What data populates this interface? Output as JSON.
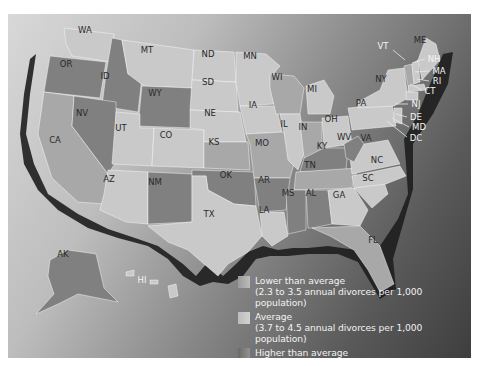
{
  "map": {
    "title": "",
    "states": [
      {
        "code": "WA",
        "x": 85,
        "y": 30,
        "cls": "low"
      },
      {
        "code": "OR",
        "x": 66,
        "y": 64,
        "cls": "high"
      },
      {
        "code": "CA",
        "x": 55,
        "y": 140,
        "cls": "avg"
      },
      {
        "code": "ID",
        "x": 105,
        "y": 76,
        "cls": "high"
      },
      {
        "code": "NV",
        "x": 82,
        "y": 113,
        "cls": "high"
      },
      {
        "code": "MT",
        "x": 147,
        "y": 50,
        "cls": "low"
      },
      {
        "code": "WY",
        "x": 155,
        "y": 93,
        "cls": "high"
      },
      {
        "code": "UT",
        "x": 121,
        "y": 128,
        "cls": "low"
      },
      {
        "code": "CO",
        "x": 166,
        "y": 135,
        "cls": "low"
      },
      {
        "code": "AZ",
        "x": 109,
        "y": 179,
        "cls": "low"
      },
      {
        "code": "NM",
        "x": 155,
        "y": 182,
        "cls": "high"
      },
      {
        "code": "ND",
        "x": 208,
        "y": 54,
        "cls": "low"
      },
      {
        "code": "SD",
        "x": 208,
        "y": 82,
        "cls": "low"
      },
      {
        "code": "NE",
        "x": 210,
        "y": 113,
        "cls": "low"
      },
      {
        "code": "KS",
        "x": 214,
        "y": 142,
        "cls": "avg"
      },
      {
        "code": "OK",
        "x": 226,
        "y": 175,
        "cls": "high"
      },
      {
        "code": "TX",
        "x": 209,
        "y": 214,
        "cls": "low"
      },
      {
        "code": "MN",
        "x": 250,
        "y": 56,
        "cls": "low"
      },
      {
        "code": "IA",
        "x": 253,
        "y": 105,
        "cls": "low"
      },
      {
        "code": "MO",
        "x": 262,
        "y": 143,
        "cls": "avg"
      },
      {
        "code": "AR",
        "x": 264,
        "y": 180,
        "cls": "high"
      },
      {
        "code": "LA",
        "x": 264,
        "y": 210,
        "cls": "low"
      },
      {
        "code": "WI",
        "x": 277,
        "y": 77,
        "cls": "avg"
      },
      {
        "code": "IL",
        "x": 284,
        "y": 124,
        "cls": "low"
      },
      {
        "code": "MI",
        "x": 312,
        "y": 89,
        "cls": "low"
      },
      {
        "code": "IN",
        "x": 303,
        "y": 127,
        "cls": "avg"
      },
      {
        "code": "OH",
        "x": 331,
        "y": 119,
        "cls": "low"
      },
      {
        "code": "KY",
        "x": 322,
        "y": 146,
        "cls": "high"
      },
      {
        "code": "TN",
        "x": 310,
        "y": 165,
        "cls": "avg"
      },
      {
        "code": "MS",
        "x": 288,
        "y": 193,
        "cls": "high"
      },
      {
        "code": "AL",
        "x": 311,
        "y": 193,
        "cls": "high"
      },
      {
        "code": "GA",
        "x": 339,
        "y": 195,
        "cls": "low"
      },
      {
        "code": "FL",
        "x": 373,
        "y": 240,
        "cls": "avg"
      },
      {
        "code": "SC",
        "x": 368,
        "y": 178,
        "cls": "low"
      },
      {
        "code": "NC",
        "x": 377,
        "y": 160,
        "cls": "low"
      },
      {
        "code": "VA",
        "x": 366,
        "y": 138,
        "cls": "low"
      },
      {
        "code": "WV",
        "x": 344,
        "y": 137,
        "cls": "high"
      },
      {
        "code": "PA",
        "x": 361,
        "y": 103,
        "cls": "low"
      },
      {
        "code": "NY",
        "x": 381,
        "y": 79,
        "cls": "low"
      },
      {
        "code": "ME",
        "x": 420,
        "y": 40,
        "cls": "low"
      },
      {
        "code": "AK",
        "x": 63,
        "y": 254,
        "cls": "high"
      },
      {
        "code": "HI",
        "x": 142,
        "y": 280,
        "cls": "low"
      }
    ],
    "callouts": [
      {
        "code": "VT",
        "tx": 383,
        "ty": 46,
        "lx1": 393,
        "ly1": 50,
        "lx2": 405,
        "ly2": 60
      },
      {
        "code": "NH",
        "tx": 434,
        "ty": 59,
        "lx1": 425,
        "ly1": 59,
        "lx2": 412,
        "ly2": 63
      },
      {
        "code": "MA",
        "tx": 439,
        "ty": 71,
        "lx1": 429,
        "ly1": 71,
        "lx2": 415,
        "ly2": 72
      },
      {
        "code": "RI",
        "tx": 437,
        "ty": 81,
        "lx1": 429,
        "ly1": 81,
        "lx2": 417,
        "ly2": 79
      },
      {
        "code": "CT",
        "tx": 430,
        "ty": 91,
        "lx1": 422,
        "ly1": 90,
        "lx2": 410,
        "ly2": 84
      },
      {
        "code": "NJ",
        "tx": 416,
        "ty": 104,
        "lx1": 408,
        "ly1": 104,
        "lx2": 395,
        "ly2": 104
      },
      {
        "code": "DE",
        "tx": 416,
        "ty": 117,
        "lx1": 407,
        "ly1": 117,
        "lx2": 396,
        "ly2": 114
      },
      {
        "code": "MD",
        "tx": 419,
        "ty": 127,
        "lx1": 409,
        "ly1": 127,
        "lx2": 392,
        "ly2": 118
      },
      {
        "code": "DC",
        "tx": 416,
        "ty": 138,
        "lx1": 407,
        "ly1": 137,
        "lx2": 387,
        "ly2": 121
      }
    ]
  },
  "legend": {
    "items": [
      {
        "label": "Lower than average",
        "detail": "(2.3 to 3.5 annual divorces per 1,000 population)",
        "swatch": "#a9a9a9"
      },
      {
        "label": "Average",
        "detail": "(3.7 to 4.5 annual divorces per 1,000 population)",
        "swatch": "#c8c8c8"
      },
      {
        "label": "Higher than average",
        "detail": "(4.9 to 6.8 annual divorces per 1,000 population)",
        "swatch": "#7d7d7d"
      }
    ]
  },
  "colors": {
    "low": "#c9c9c9",
    "avg": "#a8a8a8",
    "high": "#808080",
    "coast_shadow": "#1e1e1e"
  }
}
